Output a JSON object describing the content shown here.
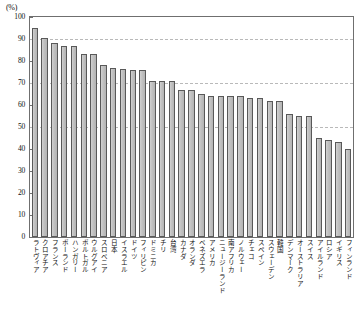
{
  "unit_label": "(%)",
  "axis": {
    "y_ticks": [
      0,
      10,
      20,
      30,
      40,
      50,
      60,
      70,
      80,
      90,
      100
    ],
    "gridlines": [
      50,
      70,
      90
    ]
  },
  "chart_data": {
    "type": "bar",
    "title": "",
    "subtitle": "",
    "xlabel": "",
    "ylabel": "(%)",
    "ylim": [
      0,
      100
    ],
    "grid": true,
    "legend": "none",
    "categories": [
      "ラトヴィア",
      "クロアチア",
      "フランス",
      "ポーランド",
      "ハンガリー",
      "ポルトガル",
      "ウルグアイ",
      "スロベニア",
      "日本",
      "イスラエル",
      "ドイツ",
      "フィリピン",
      "ドミニカ",
      "チリ",
      "台湾",
      "カナダ",
      "オランダ",
      "ベネズエラ",
      "アメリカ",
      "ニュージーランド",
      "南アフリカ",
      "ノルウェー",
      "チェコ",
      "スペイン",
      "スウェーデン",
      "韓国",
      "デンマーク",
      "オーストラリア",
      "スイス",
      "アイルランド",
      "ロシア",
      "イギリス",
      "フィンランド"
    ],
    "values": [
      95,
      90.5,
      88,
      87,
      87,
      83,
      83,
      78,
      77,
      76.5,
      76,
      76,
      71,
      71,
      71,
      67,
      67,
      65,
      64,
      64,
      64,
      64,
      63,
      63,
      62,
      62,
      56,
      55,
      55,
      45,
      44,
      43,
      40
    ],
    "y_tick_labels": [
      "0",
      "10",
      "20",
      "30",
      "40",
      "50",
      "60",
      "70",
      "80",
      "90",
      "100"
    ]
  }
}
